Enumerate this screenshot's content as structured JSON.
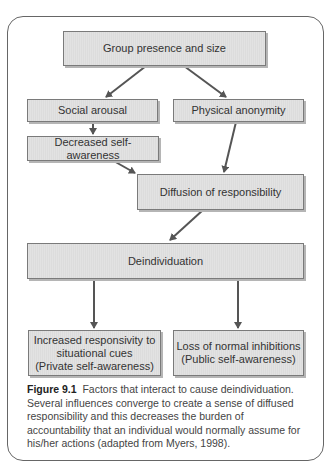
{
  "diagram": {
    "nodes": {
      "group_presence": "Group presence and size",
      "social_arousal": "Social arousal",
      "physical_anonymity": "Physical anonymity",
      "decreased_self_awareness": "Decreased self-awareness",
      "diffusion": "Diffusion of responsibility",
      "deindividuation": "Deindividuation",
      "increased_responsivity": {
        "line1": "Increased responsivity to",
        "line2": "situational cues",
        "line3": "(Private self-awareness)"
      },
      "loss_inhibitions": {
        "line1": "Loss of normal inhibitions",
        "line2": "(Public self-awareness)"
      }
    },
    "edges": [
      [
        "group_presence",
        "social_arousal"
      ],
      [
        "group_presence",
        "physical_anonymity"
      ],
      [
        "social_arousal",
        "decreased_self_awareness"
      ],
      [
        "decreased_self_awareness",
        "diffusion"
      ],
      [
        "physical_anonymity",
        "diffusion"
      ],
      [
        "diffusion",
        "deindividuation"
      ],
      [
        "deindividuation",
        "increased_responsivity"
      ],
      [
        "deindividuation",
        "loss_inhibitions"
      ]
    ]
  },
  "caption": {
    "label": "Figure 9.1",
    "text": "Factors that interact to cause deindividuation. Several influences converge to create a sense of diffused responsibility and this decreases the burden of accountability that an individual would normally assume for his/her actions (adapted from Myers, 1998)."
  }
}
